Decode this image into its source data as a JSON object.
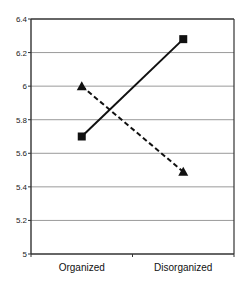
{
  "chart_data": {
    "type": "line",
    "title": "",
    "xlabel": "",
    "ylabel": "",
    "categories": [
      "Organized",
      "Disorganized"
    ],
    "series": [
      {
        "name": "Series 1 (solid line, square markers)",
        "line_style": "solid",
        "marker": "square",
        "color": "#111111",
        "values": [
          5.7,
          6.28
        ]
      },
      {
        "name": "Series 2 (dashed line, triangle markers)",
        "line_style": "dashed",
        "marker": "triangle",
        "color": "#111111",
        "values": [
          6.0,
          5.49
        ]
      }
    ],
    "ylim": [
      5,
      6.4
    ],
    "yticks": [
      5,
      5.2,
      5.4,
      5.6,
      5.8,
      6,
      6.2,
      6.4
    ],
    "ytick_labels": [
      "5",
      "5.2",
      "5.4",
      "5.6",
      "5.8",
      "6",
      "6.2",
      "6.4"
    ],
    "grid": true,
    "legend": null
  },
  "colors": {
    "axis": "#333333",
    "grid": "#9a9a9a",
    "line": "#111111"
  }
}
